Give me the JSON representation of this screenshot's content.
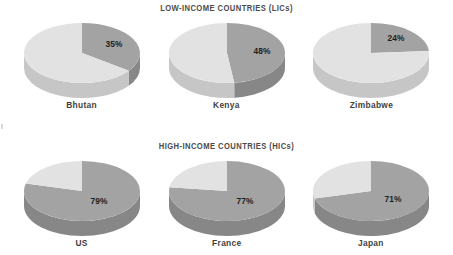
{
  "figure": {
    "background_color": "#ffffff",
    "sections": [
      {
        "id": "lic",
        "title": "LOW-INCOME COUNTRIES (LICs)"
      },
      {
        "id": "hic",
        "title": "HIGH-INCOME COUNTRIES (HICs)"
      }
    ]
  },
  "colors": {
    "slice_dark_top": "#a3a3a3",
    "slice_dark_side": "#8d8d8d",
    "slice_light_top": "#e2e2e2",
    "slice_light_side": "#c6c6c6",
    "title_text": "#4c4c4c",
    "country_text": "#3f3f3f",
    "value_text": "#1e1e1e"
  },
  "chart_data": [
    {
      "type": "pie",
      "title": "LOW-INCOME COUNTRIES (LICs)",
      "section": "lic",
      "charts": [
        {
          "label": "Bhutan",
          "value": 35,
          "value_label": "35%",
          "remainder": 65,
          "slices": [
            {
              "name": "share",
              "value": 35,
              "color": "#a3a3a3"
            },
            {
              "name": "rest",
              "value": 65,
              "color": "#e2e2e2"
            }
          ]
        },
        {
          "label": "Kenya",
          "value": 48,
          "value_label": "48%",
          "remainder": 52,
          "slices": [
            {
              "name": "share",
              "value": 48,
              "color": "#a3a3a3"
            },
            {
              "name": "rest",
              "value": 52,
              "color": "#e2e2e2"
            }
          ]
        },
        {
          "label": "Zimbabwe",
          "value": 24,
          "value_label": "24%",
          "remainder": 76,
          "slices": [
            {
              "name": "share",
              "value": 24,
              "color": "#a3a3a3"
            },
            {
              "name": "rest",
              "value": 76,
              "color": "#e2e2e2"
            }
          ]
        }
      ]
    },
    {
      "type": "pie",
      "title": "HIGH-INCOME COUNTRIES (HICs)",
      "section": "hic",
      "charts": [
        {
          "label": "US",
          "value": 79,
          "value_label": "79%",
          "remainder": 21,
          "slices": [
            {
              "name": "share",
              "value": 79,
              "color": "#a3a3a3"
            },
            {
              "name": "rest",
              "value": 21,
              "color": "#e2e2e2"
            }
          ]
        },
        {
          "label": "France",
          "value": 77,
          "value_label": "77%",
          "remainder": 23,
          "slices": [
            {
              "name": "share",
              "value": 77,
              "color": "#a3a3a3"
            },
            {
              "name": "rest",
              "value": 23,
              "color": "#e2e2e2"
            }
          ]
        },
        {
          "label": "Japan",
          "value": 71,
          "value_label": "71%",
          "remainder": 29,
          "slices": [
            {
              "name": "share",
              "value": 71,
              "color": "#a3a3a3"
            },
            {
              "name": "rest",
              "value": 29,
              "color": "#e2e2e2"
            }
          ]
        }
      ]
    }
  ]
}
